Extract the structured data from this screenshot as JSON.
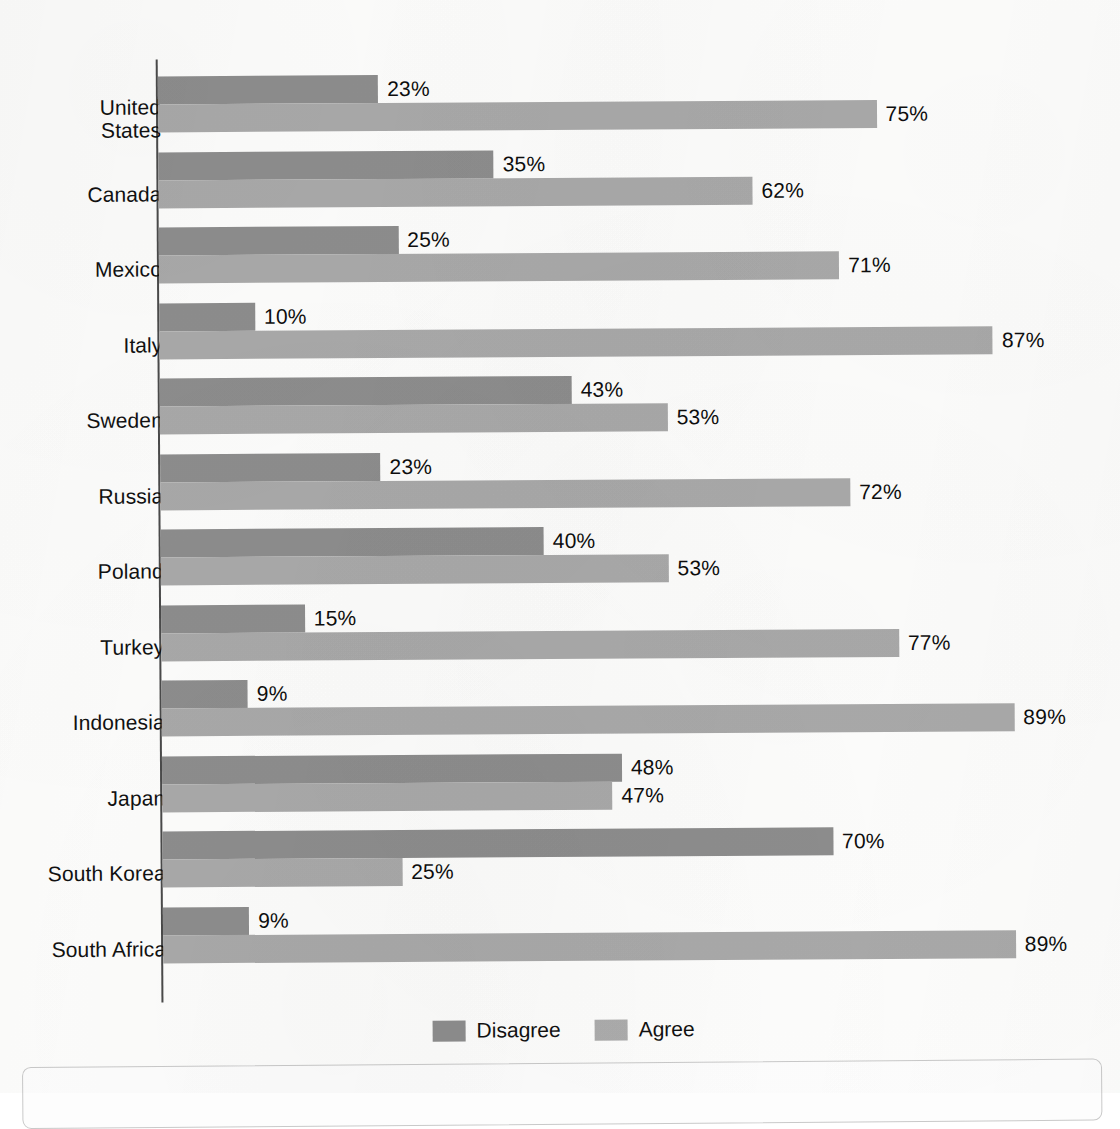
{
  "chart_data": {
    "type": "bar",
    "orientation": "horizontal",
    "title": "",
    "subtitle": "",
    "xlabel": "",
    "ylabel": "",
    "xlim": [
      0,
      100
    ],
    "grid": false,
    "legend_position": "bottom-center",
    "value_suffix": "%",
    "categories": [
      "United States",
      "Canada",
      "Mexico",
      "Italy",
      "Sweden",
      "Russia",
      "Poland",
      "Turkey",
      "Indonesia",
      "Japan",
      "South Korea",
      "South Africa"
    ],
    "series": [
      {
        "name": "Disagree",
        "color": "#8d8d8d",
        "values": [
          23,
          35,
          25,
          10,
          43,
          23,
          40,
          15,
          9,
          48,
          70,
          9
        ],
        "labels": [
          "23%",
          "35%",
          "25%",
          "10%",
          "43%",
          "23%",
          "40%",
          "15%",
          "9%",
          "48%",
          "70%",
          "9%"
        ]
      },
      {
        "name": "Agree",
        "color": "#a9a9a9",
        "values": [
          75,
          62,
          71,
          87,
          53,
          72,
          53,
          77,
          89,
          47,
          25,
          89
        ],
        "labels": [
          "75%",
          "62%",
          "71%",
          "87%",
          "53%",
          "72%",
          "53%",
          "77%",
          "89%",
          "47%",
          "25%",
          "89%"
        ]
      }
    ]
  },
  "legend": {
    "entries": [
      {
        "label": "Disagree",
        "color": "#8d8d8d"
      },
      {
        "label": "Agree",
        "color": "#a9a9a9"
      }
    ]
  },
  "colors": {
    "disagree": "#8d8d8d",
    "agree": "#a9a9a9",
    "axis": "#4a4a4a",
    "text": "#111111",
    "background": "#fdfdfc"
  }
}
